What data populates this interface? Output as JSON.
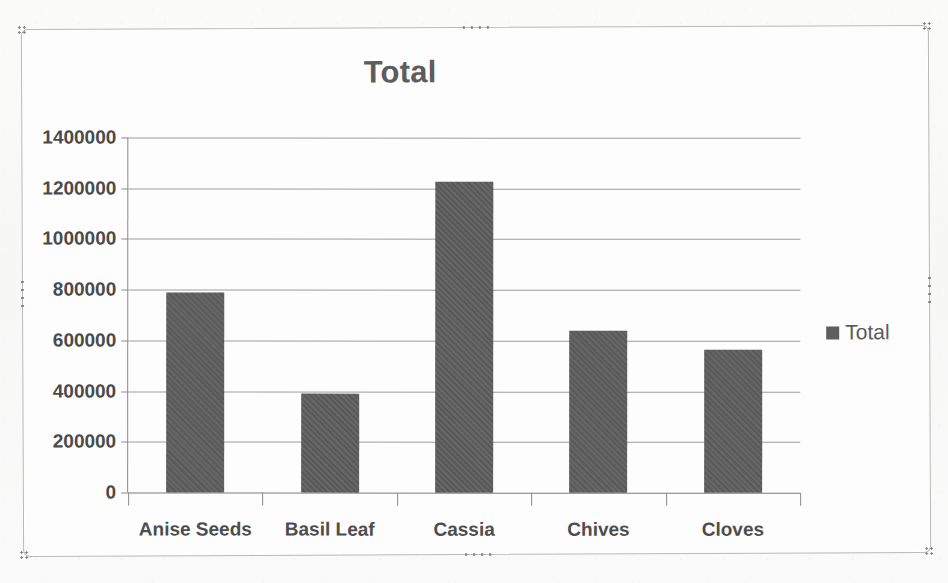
{
  "chart_data": {
    "type": "bar",
    "title": "Total",
    "xlabel": "",
    "ylabel": "",
    "categories": [
      "Anise Seeds",
      "Basil Leaf",
      "Cassia",
      "Chives",
      "Cloves"
    ],
    "values": [
      790000,
      390000,
      1225000,
      640000,
      565000
    ],
    "series": [
      {
        "name": "Total",
        "values": [
          790000,
          390000,
          1225000,
          640000,
          565000
        ]
      }
    ],
    "ylim": [
      0,
      1400000
    ],
    "ytick_step": 200000,
    "ytick_labels": [
      "0",
      "200000",
      "400000",
      "600000",
      "800000",
      "1000000",
      "1200000",
      "1400000"
    ],
    "ytick_values": [
      0,
      200000,
      400000,
      600000,
      800000,
      1000000,
      1200000,
      1400000
    ],
    "grid": "horizontal",
    "legend_position": "right",
    "legend_entries": [
      "Total"
    ],
    "series_color": "#5e5e5e",
    "title_color": "#5d5d5d",
    "gridline_color": "#9d9d9d",
    "axis_color": "#8a8a8a",
    "plot_background": "#ffffff"
  },
  "chart_object": {
    "name": "Chart 1",
    "selected": true,
    "border_color": "#b9b9b9",
    "handle_color": "#6f6f6f",
    "handles": [
      "top-left",
      "top-center",
      "top-right",
      "middle-left",
      "middle-right",
      "bottom-left",
      "bottom-center",
      "bottom-right"
    ]
  },
  "page": {
    "background_color": "#fafafa"
  }
}
